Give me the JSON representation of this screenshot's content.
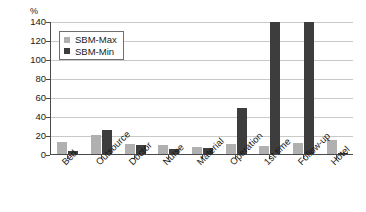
{
  "chart_data": {
    "type": "bar",
    "title": "",
    "subtitle": "",
    "xlabel": "",
    "ylabel": "%",
    "ylim": [
      0,
      140
    ],
    "ytick_step": 20,
    "yticks": [
      0,
      20,
      40,
      60,
      80,
      100,
      120,
      140
    ],
    "ytick_labels": [
      "0",
      "20",
      "40",
      "60",
      "80",
      "100",
      "120",
      "140"
    ],
    "grid": true,
    "grid_axis": "y",
    "legend_position": "upper-left-inside",
    "categories": [
      "Bed",
      "Outsource",
      "Doctor",
      "Nurse",
      "Material",
      "Operation",
      "1st time",
      "Follow-up",
      "Hotel"
    ],
    "series": [
      {
        "name": "SBM-Max",
        "color": "#b0b0b0",
        "values": [
          13,
          20,
          11,
          9,
          7,
          11,
          8,
          12,
          15
        ]
      },
      {
        "name": "SBM-Min",
        "color": "#3d3d3d",
        "values": [
          3,
          25,
          10,
          5,
          6,
          48,
          150,
          150,
          1
        ]
      }
    ],
    "clipped_categories": [
      "1st time",
      "Follow-up"
    ],
    "annotations": []
  },
  "legend": {
    "entries": [
      {
        "label": "SBM-Max",
        "swatch": "max"
      },
      {
        "label": "SBM-Min",
        "swatch": "min"
      }
    ]
  },
  "axis": {
    "y_unit_label": "%"
  }
}
